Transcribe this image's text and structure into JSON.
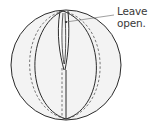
{
  "diagram": {
    "callout": {
      "line1": "Leave",
      "line2": "open."
    },
    "colors": {
      "outline": "#2b2b2b",
      "fill": "#f3f3f3",
      "stitch": "#555555",
      "text": "#3a3a3a"
    }
  }
}
